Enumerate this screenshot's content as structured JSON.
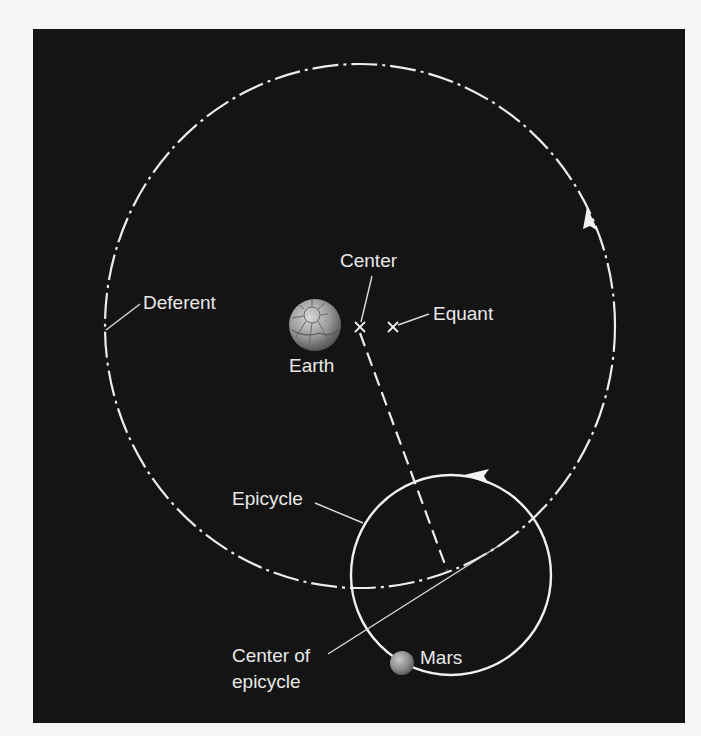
{
  "diagram": {
    "colors": {
      "page_background": "#f6f6f6",
      "panel_background": "#141414",
      "line": "#ececec",
      "label": "#e9e9e9",
      "earth": "#9a9a9a",
      "mars": "#8c8c8c"
    },
    "labels": {
      "deferent": "Deferent",
      "center": "Center",
      "equant": "Equant",
      "earth": "Earth",
      "epicycle": "Epicycle",
      "center_of_epicycle_line1": "Center of",
      "center_of_epicycle_line2": "epicycle",
      "mars": "Mars"
    },
    "elements": {
      "deferent_circle": {
        "style": "dash-dot",
        "direction": "counter-clockwise",
        "cx": 360,
        "cy": 326,
        "rx": 255,
        "ry": 262
      },
      "epicycle_circle": {
        "style": "solid",
        "direction": "counter-clockwise",
        "cx": 451,
        "cy": 575,
        "r": 100
      },
      "center_mark": {
        "symbol": "x",
        "x": 360,
        "y": 327
      },
      "equant_mark": {
        "symbol": "x",
        "x": 393,
        "y": 327
      },
      "earth": {
        "x": 315,
        "y": 325,
        "r": 26
      },
      "mars": {
        "x": 402,
        "y": 663,
        "r": 12
      },
      "radius_line": {
        "style": "dashed",
        "from": [
          360,
          327
        ],
        "to": [
          447,
          572
        ]
      }
    }
  }
}
